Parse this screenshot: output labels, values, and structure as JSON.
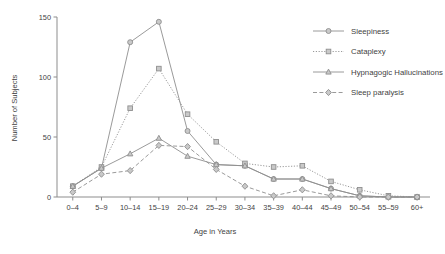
{
  "chart_data": {
    "type": "line",
    "title": "",
    "xlabel": "Age in Years",
    "ylabel": "Number of Subjects",
    "categories": [
      "0–4",
      "5–9",
      "10–14",
      "15–19",
      "20–24",
      "25–29",
      "30–34",
      "35–39",
      "40–44",
      "45–49",
      "50–54",
      "55–59",
      "60+"
    ],
    "ylim": [
      0,
      150
    ],
    "yticks": [
      0,
      50,
      100,
      150
    ],
    "ytick_labels": [
      "0",
      "50",
      "100",
      "150"
    ],
    "grid": false,
    "legend_position": "top-right",
    "series": [
      {
        "name": "Sleepiness",
        "color": "#8f8f8f",
        "marker": "circle",
        "dash": "none",
        "values": [
          9,
          24,
          129,
          146,
          55,
          27,
          26,
          15,
          15,
          7,
          1,
          0,
          0
        ]
      },
      {
        "name": "Cataplexy",
        "color": "#8f8f8f",
        "marker": "square",
        "dash": "dotted",
        "values": [
          9,
          25,
          74,
          107,
          69,
          46,
          28,
          25,
          26,
          13,
          6,
          1,
          0
        ]
      },
      {
        "name": "Hypnagogic Hallucinations",
        "color": "#8f8f8f",
        "marker": "triangle",
        "dash": "none",
        "values": [
          9,
          24,
          36,
          49,
          34,
          27,
          26,
          15,
          15,
          7,
          1,
          0,
          0
        ]
      },
      {
        "name": "Sleep paralysis",
        "color": "#8f8f8f",
        "marker": "diamond",
        "dash": "dashed",
        "values": [
          4,
          19,
          22,
          43,
          42,
          23,
          9,
          1,
          6,
          1,
          0,
          0,
          0
        ]
      }
    ]
  },
  "legend": {
    "items": [
      {
        "label": "Sleepiness"
      },
      {
        "label": "Cataplexy"
      },
      {
        "label": "Hypnagogic Hallucinations"
      },
      {
        "label": "Sleep paralysis"
      }
    ]
  }
}
